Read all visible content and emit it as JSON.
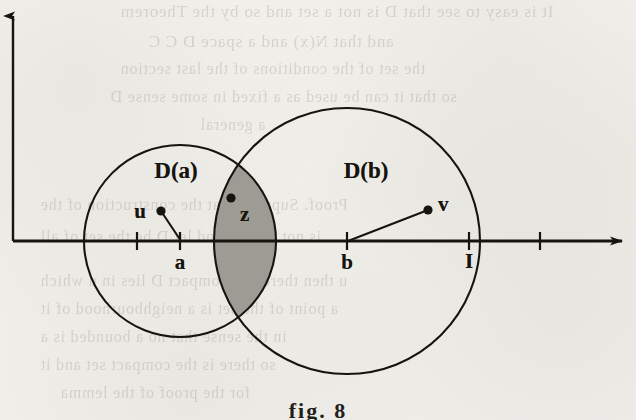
{
  "figure": {
    "caption": "fig. 8",
    "background_color": "#f2f1ed",
    "ink_color": "#16140f",
    "lens_fill_color": "#9e9b95",
    "axes": {
      "vertical_axis": {
        "x": 13,
        "y_top": 10,
        "y_bottom": 241,
        "arrow": "up"
      },
      "horizontal_axis": {
        "y": 241,
        "x_left": 13,
        "x_right": 628,
        "arrow": "right"
      }
    },
    "circles": [
      {
        "name": "D(a)",
        "label": "D(a)",
        "cx": 180,
        "cy": 241,
        "r": 96,
        "label_x": 176,
        "label_y": 171
      },
      {
        "name": "D(b)",
        "label": "D(b)",
        "cx": 347,
        "cy": 241,
        "r": 133,
        "label_x": 366,
        "label_y": 171
      }
    ],
    "axis_ticks": [
      {
        "label": "",
        "x": 137
      },
      {
        "label": "a",
        "x": 180,
        "label_x": 180,
        "label_y": 262
      },
      {
        "label": "b",
        "x": 347,
        "label_x": 347,
        "label_y": 262
      },
      {
        "label": "I",
        "x": 469,
        "label_x": 469,
        "label_y": 261
      },
      {
        "label": "",
        "x": 540
      }
    ],
    "points": [
      {
        "label": "u",
        "x": 161,
        "y": 211,
        "label_x": 146,
        "label_y": 211,
        "label_anchor": "right"
      },
      {
        "label": "z",
        "x": 231,
        "y": 198,
        "label_x": 240,
        "label_y": 214,
        "label_anchor": "left"
      },
      {
        "label": "v",
        "x": 428,
        "y": 210,
        "label_x": 438,
        "label_y": 204,
        "label_anchor": "left"
      }
    ],
    "segments": [
      {
        "name": "u-to-a",
        "x1": 161,
        "y1": 211,
        "x2": 181,
        "y2": 241
      },
      {
        "name": "v-to-b",
        "x1": 428,
        "y1": 210,
        "x2": 348,
        "y2": 241
      }
    ],
    "caption_x": 318,
    "caption_y": 398
  },
  "ghost_text": [
    {
      "text": "It is easy to see that D is not a set and so by the Theorem",
      "x": 120,
      "y": 2,
      "size": 17
    },
    {
      "text": "and that  N(x) and  a  space  D  C C",
      "x": 148,
      "y": 32,
      "size": 17
    },
    {
      "text": "the  set of  the  conditions  of  the  last  section",
      "x": 120,
      "y": 60,
      "size": 16
    },
    {
      "text": "so that  it  can  be  used  as  a  fixed  in  some  sense  D",
      "x": 110,
      "y": 88,
      "size": 16
    },
    {
      "text": "a  general",
      "x": 200,
      "y": 116,
      "size": 16
    },
    {
      "text": "Proof.  Suppose  that  the  construction  of  the",
      "x": 40,
      "y": 196,
      "size": 16
    },
    {
      "text": "is  not  a  point  and  let  D  be  the  set  of  all",
      "x": 40,
      "y": 228,
      "size": 16
    },
    {
      "text": "u  then  there  is  a  compact  D  lies  in  u  which",
      "x": 40,
      "y": 272,
      "size": 16
    },
    {
      "text": "a  point  of  the  set  is  a  neighbourhood  of  it",
      "x": 40,
      "y": 300,
      "size": 16
    },
    {
      "text": "in  the  sense  that  no  a  bounded  is  a",
      "x": 40,
      "y": 328,
      "size": 16
    },
    {
      "text": "so  there  is  the  compact  set  and  it",
      "x": 40,
      "y": 356,
      "size": 16
    },
    {
      "text": "for  the  proof  of  the  lemma",
      "x": 60,
      "y": 384,
      "size": 16
    }
  ]
}
